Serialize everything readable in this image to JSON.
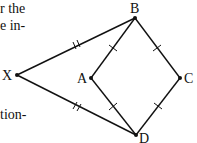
{
  "text_fragments": {
    "line1": "r the",
    "line2": "e in-",
    "line3": "tion-"
  },
  "figure": {
    "points": {
      "X": {
        "label": "X",
        "x": 17,
        "y": 75
      },
      "A": {
        "label": "A",
        "x": 91,
        "y": 78
      },
      "B": {
        "label": "B",
        "x": 135,
        "y": 18
      },
      "C": {
        "label": "C",
        "x": 180,
        "y": 78
      },
      "D": {
        "label": "D",
        "x": 136,
        "y": 135
      }
    },
    "segments": [
      {
        "from": "X",
        "to": "B",
        "ticks": 2
      },
      {
        "from": "X",
        "to": "D",
        "ticks": 2
      },
      {
        "from": "A",
        "to": "B",
        "ticks": 1
      },
      {
        "from": "B",
        "to": "C",
        "ticks": 1
      },
      {
        "from": "A",
        "to": "D",
        "ticks": 1
      },
      {
        "from": "C",
        "to": "D",
        "ticks": 1
      }
    ],
    "stroke_color": "#111111"
  }
}
